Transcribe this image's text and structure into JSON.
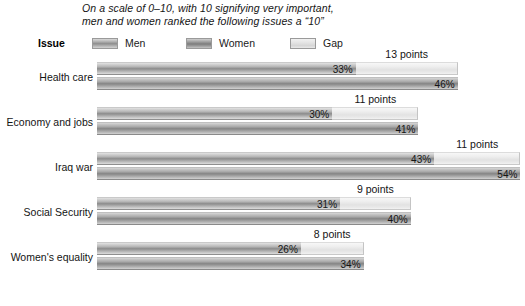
{
  "title": {
    "line1": "On a scale of 0–10, with 10 signifying very important,",
    "line2": "men and women ranked the following issues a “10”"
  },
  "legend": {
    "axis_header": "Issue",
    "items": [
      {
        "label": "Men",
        "key": "men",
        "color": "#a3a3a3"
      },
      {
        "label": "Women",
        "key": "women",
        "color": "#959595"
      },
      {
        "label": "Gap",
        "key": "gap",
        "color": "#e6e6e6"
      }
    ]
  },
  "chart_data": {
    "type": "bar",
    "title": "On a scale of 0–10, with 10 signifying very important, men and women ranked the following issues a “10”",
    "xlabel": "",
    "ylabel": "Issue",
    "orientation": "horizontal",
    "grid": false,
    "legend_position": "top",
    "xlim": [
      0,
      54
    ],
    "categories": [
      "Health care",
      "Economy and jobs",
      "Iraq war",
      "Social Security",
      "Women's equality"
    ],
    "series": [
      {
        "name": "Men",
        "values": [
          33,
          30,
          43,
          31,
          26
        ]
      },
      {
        "name": "Women",
        "values": [
          46,
          41,
          54,
          40,
          34
        ]
      },
      {
        "name": "Gap",
        "values": [
          13,
          11,
          11,
          9,
          8
        ]
      }
    ],
    "rows": [
      {
        "category": "Health care",
        "men_value": 33,
        "men_label": "33%",
        "women_value": 46,
        "women_label": "46%",
        "gap_value": 13,
        "gap_label": "13 points"
      },
      {
        "category": "Economy and jobs",
        "men_value": 30,
        "men_label": "30%",
        "women_value": 41,
        "women_label": "41%",
        "gap_value": 11,
        "gap_label": "11 points"
      },
      {
        "category": "Iraq war",
        "men_value": 43,
        "men_label": "43%",
        "women_value": 54,
        "women_label": "54%",
        "gap_value": 11,
        "gap_label": "11 points"
      },
      {
        "category": "Social Security",
        "men_value": 31,
        "men_label": "31%",
        "women_value": 40,
        "women_label": "40%",
        "gap_value": 9,
        "gap_label": "9 points"
      },
      {
        "category": "Women's equality",
        "men_value": 26,
        "men_label": "26%",
        "women_value": 34,
        "women_label": "34%",
        "gap_value": 8,
        "gap_label": "8 points"
      }
    ]
  }
}
